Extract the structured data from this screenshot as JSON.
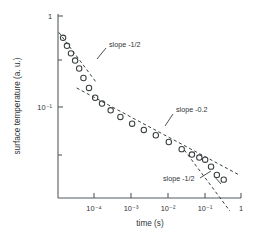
{
  "chart_data": {
    "type": "scatter",
    "title": "",
    "xlabel": "time (s)",
    "ylabel": "surface temperature (a. u.)",
    "xscale": "log",
    "yscale": "log",
    "xlim": [
      2e-05,
      1
    ],
    "ylim": [
      0.018,
      1.05
    ],
    "grid": false,
    "legend": "none",
    "marker": "open-circle",
    "xtick_labels": [
      "10⁻⁴",
      "10⁻³",
      "10⁻²",
      "10⁻¹",
      "1"
    ],
    "xtick_values": [
      0.0001,
      0.001,
      0.01,
      0.1,
      1
    ],
    "ytick_labels": [
      "1",
      "10⁻¹"
    ],
    "ytick_values": [
      1,
      0.1
    ],
    "yminor_tick_values": [
      0.3,
      0.03
    ],
    "series": [
      {
        "name": "surface temperature decay",
        "x": [
          2.7e-05,
          3.4e-05,
          4.3e-05,
          5.5e-05,
          7e-05,
          9e-05,
          0.000125,
          0.00018,
          0.00027,
          0.00045,
          0.0008,
          0.0016,
          0.0032,
          0.0065,
          0.014,
          0.03,
          0.055,
          0.085,
          0.12,
          0.17,
          0.24,
          0.36
        ],
        "y": [
          0.62,
          0.52,
          0.44,
          0.375,
          0.315,
          0.255,
          0.205,
          0.165,
          0.145,
          0.125,
          0.108,
          0.093,
          0.081,
          0.072,
          0.062,
          0.053,
          0.047,
          0.044,
          0.042,
          0.036,
          0.03,
          0.027
        ]
      }
    ],
    "fit_lines": [
      {
        "name": "early-slope-half",
        "slope": -0.5,
        "x_start": 2.1e-05,
        "x_end": 0.00019,
        "y_start": 0.7,
        "label": "slope -1/2"
      },
      {
        "name": "mid-slope-point-two",
        "slope": -0.2,
        "x_start": 6e-05,
        "x_end": 0.95,
        "y_start": 0.205,
        "label": "slope -0.2"
      },
      {
        "name": "late-slope-half",
        "slope": -0.5,
        "x_start": 0.035,
        "x_end": 0.52,
        "y_start": 0.052,
        "label": "slope -1/2"
      }
    ],
    "annotations": [
      {
        "name": "annotation-slope-half-early",
        "text": "slope -1/2"
      },
      {
        "name": "annotation-slope-point-two",
        "text": "slope -0.2"
      },
      {
        "name": "annotation-slope-half-late",
        "text": "slope -1/2"
      }
    ],
    "colors": {
      "axis": "#555b5e",
      "marker": "#3b4042",
      "fitline": "#3a3f42",
      "text": "#2f3436",
      "background": "#ffffff"
    }
  }
}
